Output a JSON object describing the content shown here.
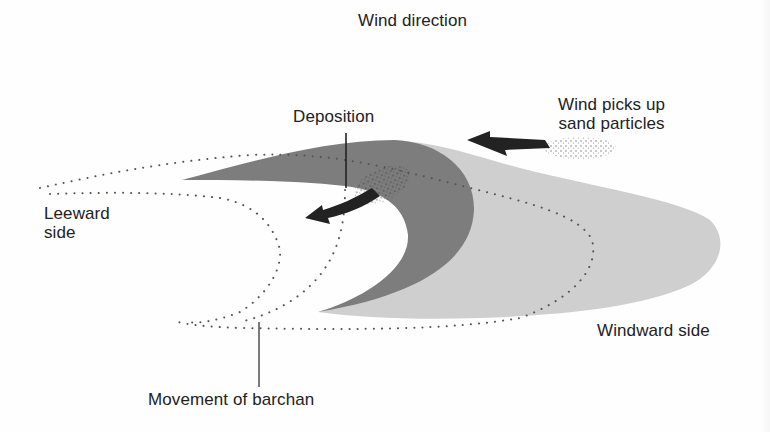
{
  "diagram": {
    "type": "barchan-dune-cross-section",
    "labels": {
      "wind_direction": "Wind direction",
      "wind_picks_up": [
        "Wind picks up",
        "sand particles"
      ],
      "deposition": "Deposition",
      "leeward": [
        "Leeward",
        "side"
      ],
      "windward": "Windward side",
      "movement": "Movement of barchan"
    },
    "colors": {
      "slip_face": "#7d7d7d",
      "windward_slope": "#cfcfcf",
      "arrow": "#222222",
      "dots": "#555555",
      "background": "#ffffff",
      "text": "#222222"
    }
  }
}
